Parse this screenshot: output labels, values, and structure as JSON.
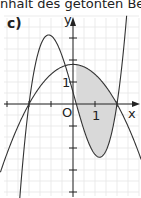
{
  "caption": "nhalt des getönten Bereichs.",
  "part_label": "c)",
  "chart_data": {
    "type": "line",
    "title": "",
    "xlabel": "x",
    "ylabel": "y",
    "origin_label": "O",
    "tick_labels": {
      "x": "1",
      "y": "1"
    },
    "xlim": [
      -3.3,
      3.0
    ],
    "ylim": [
      -4.2,
      4.5
    ],
    "grid": true,
    "series": [
      {
        "name": "downward parabola",
        "formula": "y = 0.45*(4 - x^2)",
        "zeros": [
          -2,
          2
        ],
        "vertex": [
          0,
          1.8
        ]
      },
      {
        "name": "cubic",
        "formula": "y = 0.9*(x+2)*(x-0.15)*(x-2)",
        "zeros": [
          -2,
          0.15,
          2
        ]
      }
    ],
    "shaded_region": {
      "between": [
        "downward parabola",
        "cubic"
      ],
      "x_range": [
        0.15,
        2
      ],
      "color": "#d9d9d9"
    }
  },
  "colors": {
    "grid": "#e6e6e6",
    "axis": "#222222",
    "curve": "#333333",
    "shade": "#d9d9d9"
  }
}
